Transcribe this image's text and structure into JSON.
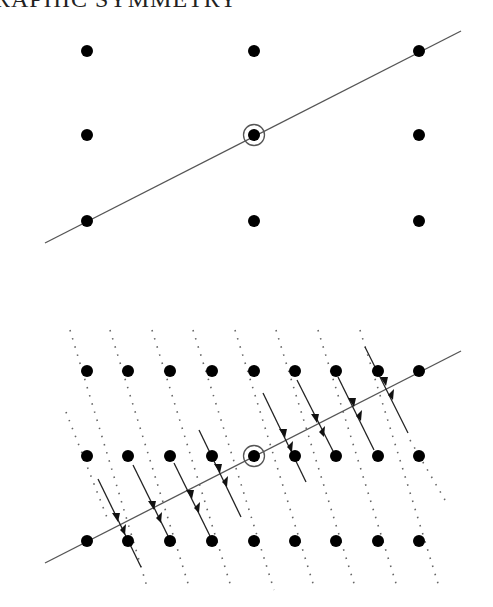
{
  "header": {
    "title_fragment": "RAPHIC SYMMETRY"
  },
  "top_diagram": {
    "description": "3x3 lattice of points with a symmetry line through the circled center point",
    "columns_x": [
      87,
      254,
      419
    ],
    "rows_y": [
      51,
      135,
      221
    ],
    "center": [
      254,
      135
    ],
    "line": {
      "x1": 45,
      "y1": 243,
      "x2": 461,
      "y2": 31
    }
  },
  "bottom_diagram": {
    "description": "9x3 lattice with dotted projection lines and arrow pairs converging to the symmetry line",
    "columns_x": [
      87,
      128,
      170,
      212,
      254,
      295,
      336,
      378,
      419
    ],
    "rows_y": [
      371,
      456,
      541
    ],
    "center": [
      254,
      456
    ],
    "line": {
      "x1": 45,
      "y1": 563,
      "x2": 461,
      "y2": 351
    }
  },
  "colors": {
    "dot": "#000000",
    "line": "#555555",
    "dotted": "#666666"
  }
}
